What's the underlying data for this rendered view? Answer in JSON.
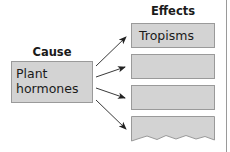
{
  "cause": {
    "heading": "Cause",
    "label_line1": "Plant",
    "label_line2": "hormones"
  },
  "effects": {
    "heading": "Effects",
    "items": [
      {
        "label": "Tropisms"
      },
      {
        "label": ""
      },
      {
        "label": ""
      },
      {
        "label": ""
      }
    ]
  },
  "colors": {
    "box_fill": "#d3d3d3",
    "box_border": "#9a9a9a",
    "arrow": "#222222",
    "text": "#1a1a1a"
  }
}
